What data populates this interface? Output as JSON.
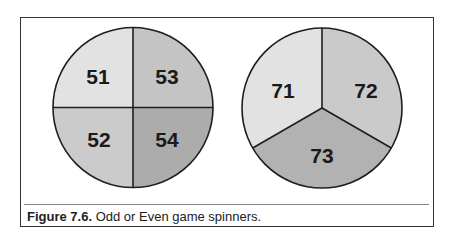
{
  "figure": {
    "label": "Figure 7.6.",
    "caption": " Odd or Even game spinners."
  },
  "spinners": [
    {
      "name": "four-section spinner",
      "sections": [
        {
          "label": "51",
          "color": "#e2e2e2"
        },
        {
          "label": "53",
          "color": "#c4c4c4"
        },
        {
          "label": "52",
          "color": "#cbcbcb"
        },
        {
          "label": "54",
          "color": "#acacac"
        }
      ]
    },
    {
      "name": "three-section spinner",
      "sections": [
        {
          "label": "71",
          "color": "#e2e2e2"
        },
        {
          "label": "72",
          "color": "#cacaca"
        },
        {
          "label": "73",
          "color": "#b2b2b2"
        }
      ]
    }
  ]
}
